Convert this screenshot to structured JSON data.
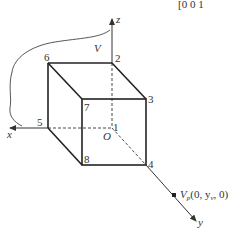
{
  "matrix_fragment": {
    "text": "[0   0   1"
  },
  "axes": {
    "x": {
      "label": "x"
    },
    "y": {
      "label": "y"
    },
    "z": {
      "label": "z"
    },
    "origin": {
      "label": "O"
    }
  },
  "region_label": "V",
  "vertices": [
    {
      "id": "1",
      "label": "1"
    },
    {
      "id": "2",
      "label": "2"
    },
    {
      "id": "3",
      "label": "3"
    },
    {
      "id": "4",
      "label": "4"
    },
    {
      "id": "5",
      "label": "5"
    },
    {
      "id": "6",
      "label": "6"
    },
    {
      "id": "7",
      "label": "7"
    },
    {
      "id": "8",
      "label": "8"
    }
  ],
  "viewpoint": {
    "label": "V",
    "subscript": "p",
    "coords": "(0, y",
    "coord_subscript": "v",
    "coords_end": ", 0)"
  },
  "colors": {
    "line": "#333333",
    "background": "#ffffff"
  }
}
